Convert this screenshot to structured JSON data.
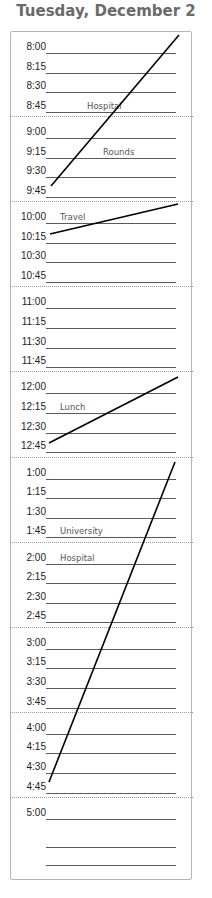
{
  "header": {
    "title": "Tuesday, December 2"
  },
  "slots": [
    {
      "time": "8:00",
      "entry": ""
    },
    {
      "time": "8:15",
      "entry": ""
    },
    {
      "time": "8:30",
      "entry": ""
    },
    {
      "time": "8:45",
      "entry": "Hospital"
    },
    {
      "time": "9:00",
      "entry": ""
    },
    {
      "time": "9:15",
      "entry": "Rounds"
    },
    {
      "time": "9:30",
      "entry": ""
    },
    {
      "time": "9:45",
      "entry": ""
    },
    {
      "time": "10:00",
      "entry": "Travel"
    },
    {
      "time": "10:15",
      "entry": ""
    },
    {
      "time": "10:30",
      "entry": ""
    },
    {
      "time": "10:45",
      "entry": ""
    },
    {
      "time": "11:00",
      "entry": ""
    },
    {
      "time": "11:15",
      "entry": ""
    },
    {
      "time": "11:30",
      "entry": ""
    },
    {
      "time": "11:45",
      "entry": ""
    },
    {
      "time": "12:00",
      "entry": ""
    },
    {
      "time": "12:15",
      "entry": "Lunch"
    },
    {
      "time": "12:30",
      "entry": ""
    },
    {
      "time": "12:45",
      "entry": ""
    },
    {
      "time": "1:00",
      "entry": ""
    },
    {
      "time": "1:15",
      "entry": ""
    },
    {
      "time": "1:30",
      "entry": ""
    },
    {
      "time": "1:45",
      "entry": "University"
    },
    {
      "time": "2:00",
      "entry": "Hospital"
    },
    {
      "time": "2:15",
      "entry": ""
    },
    {
      "time": "2:30",
      "entry": ""
    },
    {
      "time": "2:45",
      "entry": ""
    },
    {
      "time": "3:00",
      "entry": ""
    },
    {
      "time": "3:15",
      "entry": ""
    },
    {
      "time": "3:30",
      "entry": ""
    },
    {
      "time": "3:45",
      "entry": ""
    },
    {
      "time": "4:00",
      "entry": ""
    },
    {
      "time": "4:15",
      "entry": ""
    },
    {
      "time": "4:30",
      "entry": ""
    },
    {
      "time": "4:45",
      "entry": ""
    },
    {
      "time": "5:00",
      "entry": ""
    },
    {
      "time": "",
      "entry": ""
    },
    {
      "time": "",
      "entry": ""
    }
  ],
  "blocks": [
    {
      "label": "Hospital Rounds",
      "from": "8:00",
      "to": "9:45"
    },
    {
      "label": "Travel",
      "from": "10:00",
      "to": "10:15"
    },
    {
      "label": "Lunch",
      "from": "12:00",
      "to": "12:45"
    },
    {
      "label": "University / Hospital",
      "from": "1:00",
      "to": "4:45"
    }
  ],
  "colors": {
    "title": "#6a6a6a",
    "rule": "#5a5a5a",
    "ink": "#000000",
    "border": "#b5b5b5"
  }
}
